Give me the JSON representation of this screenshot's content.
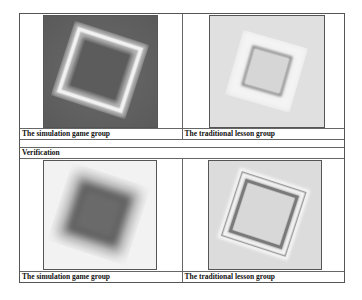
{
  "table": {
    "results_row": {
      "left_caption": "The simulation game group",
      "right_caption": "The traditional lesson group",
      "left_image": "rotated-square-dark-background-bright-outline",
      "right_image": "rotated-square-light-background-dark-outline"
    },
    "verification_label": "Verification",
    "verification_row": {
      "left_caption": "The simulation game group",
      "right_caption": "The traditional lesson group",
      "left_image": "rotated-square-blurred-dark-fill",
      "right_image": "rotated-square-light-background-double-outline"
    }
  }
}
